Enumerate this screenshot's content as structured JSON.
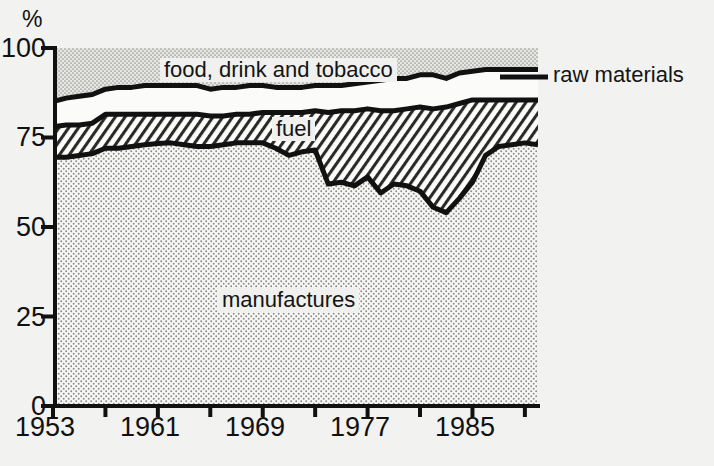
{
  "chart_data": {
    "type": "area",
    "title": "",
    "subtitle": "",
    "xlabel": "",
    "ylabel": "%",
    "ylim": [
      0,
      100
    ],
    "xlim": [
      1953,
      1990
    ],
    "grid": false,
    "stacked": true,
    "stack_order_bottom_to_top": [
      "manufactures",
      "fuel",
      "basic materials gap",
      "food, drink and tobacco"
    ],
    "yticks": [
      0,
      25,
      50,
      75,
      100
    ],
    "ytick_labels": [
      "0",
      "25",
      "50",
      "75",
      "100"
    ],
    "xticks": [
      1953,
      1957,
      1961,
      1965,
      1969,
      1973,
      1977,
      1981,
      1985,
      1989
    ],
    "xtick_labels_shown": [
      "1953",
      "1961",
      "1969",
      "1977",
      "1985"
    ],
    "xtick_labels_shown_values": [
      1953,
      1961,
      1969,
      1977,
      1985
    ],
    "legend_position": "in-plot annotations",
    "annotations": [
      {
        "text": "food, drink and tobacco",
        "band": "top"
      },
      {
        "text": "raw materials",
        "band": "upper-middle",
        "leader_line": true
      },
      {
        "text": "fuel",
        "band": "middle"
      },
      {
        "text": "manufactures",
        "band": "bottom"
      }
    ],
    "x": [
      1953,
      1954,
      1955,
      1956,
      1957,
      1958,
      1959,
      1960,
      1961,
      1962,
      1963,
      1964,
      1965,
      1966,
      1967,
      1968,
      1969,
      1970,
      1971,
      1972,
      1973,
      1974,
      1975,
      1976,
      1977,
      1978,
      1979,
      1980,
      1981,
      1982,
      1983,
      1984,
      1985,
      1986,
      1987,
      1988,
      1989,
      1990
    ],
    "series": [
      {
        "name": "manufactures",
        "note": "cumulative top boundary of the manufactures band, in %",
        "values": [
          69.5,
          69.5,
          70.0,
          70.5,
          72.0,
          72.0,
          72.5,
          73.0,
          73.3,
          73.5,
          73.0,
          72.5,
          72.5,
          73.0,
          73.5,
          73.5,
          73.5,
          72.0,
          70.0,
          71.0,
          71.5,
          62.0,
          62.5,
          61.5,
          64.0,
          59.5,
          62.0,
          61.5,
          60.0,
          55.5,
          54.0,
          58.0,
          62.5,
          70.0,
          72.5,
          73.0,
          73.5,
          73.0
        ]
      },
      {
        "name": "fuel",
        "note": "cumulative top boundary of the fuel band (manufactures + fuel), in %",
        "values": [
          78.0,
          78.5,
          78.5,
          79.0,
          81.5,
          81.5,
          81.5,
          81.5,
          81.5,
          81.5,
          81.5,
          81.5,
          81.0,
          81.0,
          81.5,
          81.5,
          82.0,
          82.0,
          82.0,
          82.0,
          82.5,
          82.0,
          82.5,
          82.5,
          83.0,
          82.5,
          82.5,
          83.0,
          83.5,
          83.0,
          83.5,
          84.5,
          85.5,
          85.5,
          85.5,
          85.5,
          85.5,
          85.5
        ]
      },
      {
        "name": "raw materials",
        "note": "cumulative top boundary of the raw-materials band (manufactures + fuel + raw materials), in %",
        "values": [
          85.0,
          86.0,
          86.5,
          87.0,
          88.5,
          89.0,
          89.0,
          89.5,
          89.5,
          89.5,
          89.5,
          89.5,
          88.5,
          89.0,
          89.0,
          89.5,
          89.5,
          89.0,
          89.0,
          89.0,
          89.5,
          89.5,
          89.5,
          90.0,
          90.5,
          91.0,
          91.5,
          91.5,
          92.5,
          92.5,
          91.5,
          93.0,
          93.5,
          94.0,
          94.0,
          94.0,
          94.0,
          94.0
        ]
      },
      {
        "name": "food, drink and tobacco",
        "note": "remainder up to 100%",
        "values": [
          15.0,
          14.0,
          13.5,
          13.0,
          11.5,
          11.0,
          11.0,
          10.5,
          10.5,
          10.5,
          10.5,
          10.5,
          11.5,
          11.0,
          11.0,
          10.5,
          10.5,
          11.0,
          11.0,
          11.0,
          10.5,
          10.5,
          10.5,
          10.0,
          9.5,
          9.0,
          8.5,
          8.5,
          7.5,
          7.5,
          8.5,
          7.0,
          6.5,
          6.0,
          6.0,
          6.0,
          6.0,
          6.0
        ]
      }
    ]
  },
  "axis": {
    "y_unit": "%",
    "y_ticks": [
      "100",
      "75",
      "50",
      "25",
      "0"
    ],
    "x_ticks": [
      "1953",
      "1961",
      "1969",
      "1977",
      "1985"
    ]
  },
  "labels": {
    "food": "food, drink and tobacco",
    "raw": "raw materials",
    "fuel": "fuel",
    "manufactures": "manufactures"
  },
  "colors": {
    "background": "#f2f2f0",
    "ink": "#111111",
    "manufactures_fill": "#f4f4f2",
    "fuel_fill": "#ffffff",
    "raw_fill": "#fbfbfa",
    "food_fill": "#d8d8d6"
  }
}
